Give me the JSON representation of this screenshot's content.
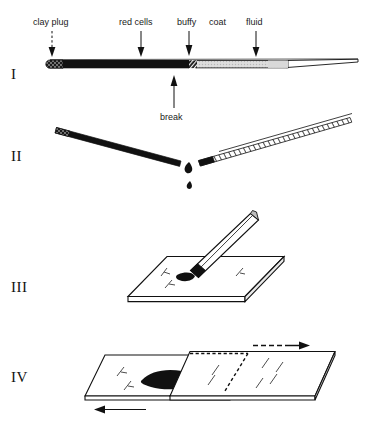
{
  "figure": {
    "background_color": "#ffffff",
    "ink_color": "#111111"
  },
  "panels": [
    {
      "numeral": "I",
      "description": "Filled capillary tube after centrifugation",
      "labels": [
        {
          "text": "clay plug",
          "arrow": "down"
        },
        {
          "text": "red cells",
          "arrow": "down"
        },
        {
          "text": "buffy",
          "arrow": "down"
        },
        {
          "text": "coat",
          "arrow": "none"
        },
        {
          "text": "fluid",
          "arrow": "down"
        }
      ],
      "bottom_label": {
        "text": "break",
        "arrow": "up"
      },
      "tube_segments": [
        {
          "name": "clay-plug",
          "color": "#2b2b2b",
          "fill": "stipple"
        },
        {
          "name": "red-cells",
          "color": "#111111",
          "fill": "solid"
        },
        {
          "name": "buffy-coat",
          "color": "#111111",
          "fill": "hatch"
        },
        {
          "name": "plasma-fluid",
          "color": "#d0d0d0",
          "fill": "light"
        },
        {
          "name": "empty-tip",
          "color": "#ffffff",
          "fill": "none"
        }
      ]
    },
    {
      "numeral": "II",
      "description": "Tube snapped at the buffy coat; drops fall from the broken ends",
      "labels": [],
      "drops": 2
    },
    {
      "numeral": "III",
      "description": "Drop of blood placed on a glass microscope slide",
      "labels": []
    },
    {
      "numeral": "IV",
      "description": "Spreader slide drawn across to make the smear",
      "labels": [],
      "arrows": [
        {
          "name": "spreader-arrow",
          "direction": "right"
        },
        {
          "name": "slide-arrow",
          "direction": "left"
        }
      ]
    }
  ],
  "colors": {
    "ink": "#111111",
    "red_cells": "#111111",
    "plasma": "#d6d6d6",
    "plasma_dark": "#c2c2c2",
    "slide_face": "#ffffff",
    "slide_edge": "#111111"
  }
}
